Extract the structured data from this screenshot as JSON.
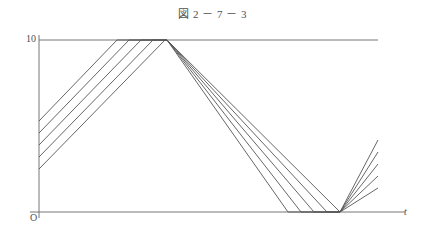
{
  "figure": {
    "title": "図 2 － 7 － 3",
    "background_color": "#ffffff",
    "line_color": "#555555",
    "axis_color": "#777777"
  },
  "axes": {
    "y_axis": {
      "name": "value-axis",
      "x_px": 39,
      "top_px": 35,
      "bottom_px": 218,
      "tick_labels": [
        "10"
      ],
      "tick_values": [
        10
      ],
      "origin_label": "O"
    },
    "x_axis": {
      "name": "time-axis",
      "y_px": 212,
      "left_px": 30,
      "right_px": 405,
      "label": "t"
    },
    "reference_line": {
      "name": "upper-bound-line",
      "value": 10,
      "y_px": 40,
      "x_start_px": 39,
      "x_end_px": 378
    }
  },
  "chart_data": {
    "type": "line",
    "title": "図 2 － 7 － 3",
    "xlabel": "t",
    "ylabel": "",
    "ylim": [
      0,
      10
    ],
    "xlim": [
      0,
      405
    ],
    "grid": false,
    "legend": null,
    "y_ticks": [
      0,
      10
    ],
    "y_tick_labels": [
      "O",
      "10"
    ],
    "series": [
      {
        "name": "wave-1",
        "points_px": [
          [
            39,
            121
          ],
          [
            117,
            40
          ],
          [
            167,
            40
          ],
          [
            288,
            212
          ],
          [
            340,
            212
          ],
          [
            378,
            140
          ]
        ]
      },
      {
        "name": "wave-2",
        "points_px": [
          [
            39,
            133
          ],
          [
            129,
            40
          ],
          [
            167,
            40
          ],
          [
            301,
            212
          ],
          [
            340,
            212
          ],
          [
            378,
            152
          ]
        ]
      },
      {
        "name": "wave-3",
        "points_px": [
          [
            39,
            145
          ],
          [
            141,
            40
          ],
          [
            167,
            40
          ],
          [
            314,
            212
          ],
          [
            340,
            212
          ],
          [
            378,
            164
          ]
        ]
      },
      {
        "name": "wave-4",
        "points_px": [
          [
            39,
            157
          ],
          [
            153,
            40
          ],
          [
            167,
            40
          ],
          [
            327,
            212
          ],
          [
            340,
            212
          ],
          [
            378,
            176
          ]
        ]
      },
      {
        "name": "wave-5",
        "points_px": [
          [
            39,
            169
          ],
          [
            165,
            40
          ],
          [
            167,
            40
          ],
          [
            340,
            212
          ],
          [
            340,
            212
          ],
          [
            378,
            188
          ]
        ]
      }
    ]
  }
}
